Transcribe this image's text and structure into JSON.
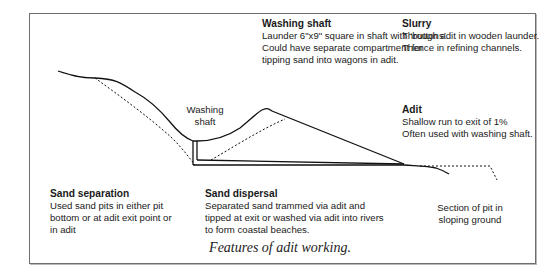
{
  "figure": {
    "caption": "Features of adit working."
  },
  "annotations": {
    "washing_shaft": {
      "title": "Washing shaft",
      "lines": [
        "Launder 6\"x9\" square in shaft with ‘buttons’",
        "Could have separate compartment for",
        "tipping sand into wagons in adit."
      ]
    },
    "slurry": {
      "title": "Slurry",
      "lines": [
        "Through adit in wooden launder.",
        "Thence in refining channels."
      ]
    },
    "adit": {
      "title": "Adit",
      "lines": [
        "Shallow run to exit of 1%",
        "Often used with washing shaft."
      ]
    },
    "sand_separation": {
      "title": "Sand separation",
      "lines": [
        "Used sand pits in either pit",
        "bottom or at adit exit point or",
        "in adit"
      ]
    },
    "sand_dispersal": {
      "title": "Sand dispersal",
      "lines": [
        "Separated sand trammed via adit and",
        "tipped at exit or washed via adit into rivers",
        "to form coastal beaches."
      ]
    },
    "washing_shaft_label": {
      "lines": [
        "Washing",
        "shaft"
      ]
    },
    "section_label": {
      "lines": [
        "Section of pit in",
        "sloping ground"
      ]
    }
  },
  "colors": {
    "line": "#111111",
    "frame": "#6e6e6e",
    "text": "#1a1a1a"
  }
}
